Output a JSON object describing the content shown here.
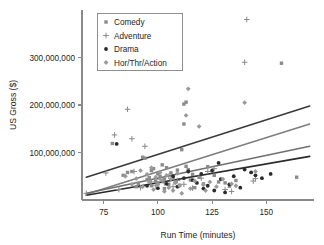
{
  "chart_data": {
    "type": "scatter",
    "title": "",
    "xlabel": "Run Time (minutes)",
    "ylabel": "US Gross ($)",
    "xlim": [
      65,
      172
    ],
    "ylim": [
      0,
      400000000
    ],
    "xticks": [
      75,
      100,
      125,
      150
    ],
    "xtick_labels": [
      "75",
      "100",
      "125",
      "150"
    ],
    "yticks": [
      100000000,
      200000000,
      300000000
    ],
    "ytick_labels": [
      "100,000,000",
      "200,000,000",
      "300,000,000"
    ],
    "grid": false,
    "legend_position": "upper-left",
    "legend_entries": [
      {
        "label": "Comedy",
        "marker": "square",
        "color": "#8a8a8a"
      },
      {
        "label": "Adventure",
        "marker": "plus",
        "color": "#8a8a8a"
      },
      {
        "label": "Drama",
        "marker": "circle",
        "color": "#2b2b2b"
      },
      {
        "label": "Hor/Thr/Action",
        "marker": "diamond",
        "color": "#9a9a9a"
      }
    ],
    "series": [
      {
        "name": "Comedy",
        "marker": "square",
        "color": "#8a8a8a",
        "points": [
          [
            79,
            119000000
          ],
          [
            84,
            52000000
          ],
          [
            86,
            58000000
          ],
          [
            88,
            60000000
          ],
          [
            90,
            28000000
          ],
          [
            91,
            35000000
          ],
          [
            93,
            90000000
          ],
          [
            94,
            88000000
          ],
          [
            95,
            43000000
          ],
          [
            96,
            47000000
          ],
          [
            97,
            62000000
          ],
          [
            97,
            30000000
          ],
          [
            98,
            66000000
          ],
          [
            99,
            40000000
          ],
          [
            100,
            55000000
          ],
          [
            100,
            36000000
          ],
          [
            101,
            50000000
          ],
          [
            102,
            74000000
          ],
          [
            103,
            44000000
          ],
          [
            103,
            24000000
          ],
          [
            104,
            68000000
          ],
          [
            105,
            33000000
          ],
          [
            106,
            57000000
          ],
          [
            107,
            46000000
          ],
          [
            108,
            38000000
          ],
          [
            109,
            63000000
          ],
          [
            110,
            31000000
          ],
          [
            111,
            106000000
          ],
          [
            112,
            202000000
          ],
          [
            112,
            160000000
          ],
          [
            113,
            71000000
          ],
          [
            113,
            206000000
          ],
          [
            114,
            64000000
          ],
          [
            115,
            42000000
          ],
          [
            116,
            54000000
          ],
          [
            117,
            26000000
          ],
          [
            119,
            48000000
          ],
          [
            121,
            34000000
          ],
          [
            123,
            70000000
          ],
          [
            126,
            52000000
          ],
          [
            128,
            38000000
          ],
          [
            131,
            36000000
          ],
          [
            133,
            29000000
          ],
          [
            136,
            41000000
          ],
          [
            157,
            288000000
          ],
          [
            164,
            48000000
          ]
        ]
      },
      {
        "name": "Adventure",
        "marker": "plus",
        "color": "#8a8a8a",
        "points": [
          [
            67,
            14000000
          ],
          [
            76,
            57000000
          ],
          [
            80,
            137000000
          ],
          [
            82,
            22000000
          ],
          [
            86,
            191000000
          ],
          [
            88,
            129000000
          ],
          [
            89,
            60000000
          ],
          [
            92,
            26000000
          ],
          [
            94,
            113000000
          ],
          [
            97,
            38000000
          ],
          [
            99,
            30000000
          ],
          [
            101,
            44000000
          ],
          [
            103,
            36000000
          ],
          [
            105,
            50000000
          ],
          [
            107,
            28000000
          ],
          [
            109,
            41000000
          ],
          [
            112,
            33000000
          ],
          [
            116,
            25000000
          ],
          [
            120,
            46000000
          ],
          [
            123,
            60000000
          ],
          [
            126,
            66000000
          ],
          [
            131,
            22000000
          ],
          [
            134,
            18000000
          ],
          [
            140,
            290000000
          ],
          [
            141,
            380000000
          ],
          [
            144,
            40000000
          ],
          [
            145,
            45000000
          ]
        ]
      },
      {
        "name": "Drama",
        "marker": "circle",
        "color": "#2b2b2b",
        "points": [
          [
            81,
            118000000
          ],
          [
            95,
            30000000
          ],
          [
            100,
            25000000
          ],
          [
            104,
            34000000
          ],
          [
            107,
            50000000
          ],
          [
            109,
            28000000
          ],
          [
            112,
            46000000
          ],
          [
            114,
            60000000
          ],
          [
            116,
            42000000
          ],
          [
            118,
            36000000
          ],
          [
            120,
            55000000
          ],
          [
            121,
            24000000
          ],
          [
            123,
            30000000
          ],
          [
            125,
            62000000
          ],
          [
            126,
            20000000
          ],
          [
            128,
            78000000
          ],
          [
            129,
            44000000
          ],
          [
            131,
            16000000
          ],
          [
            133,
            33000000
          ],
          [
            135,
            50000000
          ],
          [
            138,
            26000000
          ],
          [
            140,
            64000000
          ],
          [
            143,
            58000000
          ],
          [
            145,
            52000000
          ],
          [
            148,
            46000000
          ],
          [
            152,
            55000000
          ]
        ]
      },
      {
        "name": "Hor/Thr/Action",
        "marker": "diamond",
        "color": "#9a9a9a",
        "points": [
          [
            85,
            50000000
          ],
          [
            88,
            33000000
          ],
          [
            90,
            45000000
          ],
          [
            92,
            62000000
          ],
          [
            93,
            28000000
          ],
          [
            95,
            54000000
          ],
          [
            96,
            38000000
          ],
          [
            97,
            68000000
          ],
          [
            98,
            22000000
          ],
          [
            99,
            48000000
          ],
          [
            100,
            32000000
          ],
          [
            101,
            58000000
          ],
          [
            102,
            41000000
          ],
          [
            103,
            18000000
          ],
          [
            104,
            52000000
          ],
          [
            105,
            26000000
          ],
          [
            106,
            44000000
          ],
          [
            107,
            20000000
          ],
          [
            108,
            36000000
          ],
          [
            109,
            56000000
          ],
          [
            110,
            30000000
          ],
          [
            111,
            14000000
          ],
          [
            113,
            178000000
          ],
          [
            114,
            234000000
          ],
          [
            115,
            24000000
          ],
          [
            117,
            40000000
          ],
          [
            119,
            155000000
          ],
          [
            121,
            32000000
          ],
          [
            122,
            20000000
          ],
          [
            124,
            38000000
          ],
          [
            127,
            28000000
          ],
          [
            130,
            44000000
          ],
          [
            134,
            34000000
          ],
          [
            136,
            30000000
          ],
          [
            140,
            205000000
          ],
          [
            145,
            60000000
          ]
        ]
      }
    ],
    "fit_lines": [
      {
        "name": "Adventure-fit",
        "color": "#3a3a3a",
        "width": 1.6,
        "x0": 67,
        "y0": 48000000,
        "x1": 170,
        "y1": 198000000
      },
      {
        "name": "Comedy-fit",
        "color": "#7d7d7d",
        "width": 1.5,
        "x0": 67,
        "y0": 12000000,
        "x1": 170,
        "y1": 160000000
      },
      {
        "name": "HorThrAction-fit",
        "color": "#6f6f6f",
        "width": 1.5,
        "x0": 67,
        "y0": 14000000,
        "x1": 170,
        "y1": 113000000
      },
      {
        "name": "Drama-fit",
        "color": "#2b2b2b",
        "width": 1.7,
        "x0": 67,
        "y0": 10000000,
        "x1": 170,
        "y1": 92000000
      }
    ]
  }
}
